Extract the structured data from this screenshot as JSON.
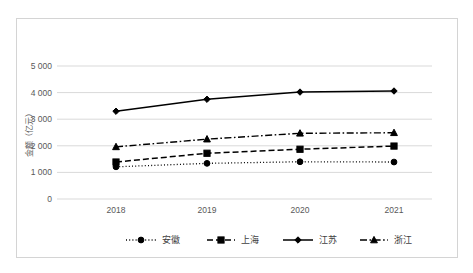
{
  "chart_data": {
    "type": "line",
    "title": "",
    "xlabel": "",
    "ylabel": "金额（亿元）",
    "categories": [
      "2018",
      "2019",
      "2020",
      "2021"
    ],
    "ylim": [
      0,
      5000
    ],
    "ytick_labels": [
      "0",
      "1 000",
      "2 000",
      "3 000",
      "4 000",
      "5 000"
    ],
    "ytick_values": [
      0,
      1000,
      2000,
      3000,
      4000,
      5000
    ],
    "grid": true,
    "legend_position": "bottom",
    "series": [
      {
        "name": "安徽",
        "values": [
          1210,
          1340,
          1400,
          1390
        ],
        "line_style": "dotted",
        "marker": "circle",
        "color": "#000000"
      },
      {
        "name": "上海",
        "values": [
          1390,
          1720,
          1870,
          1990
        ],
        "line_style": "dashed",
        "marker": "square",
        "color": "#000000"
      },
      {
        "name": "江苏",
        "values": [
          3300,
          3750,
          4020,
          4060
        ],
        "line_style": "solid",
        "marker": "diamond",
        "color": "#000000"
      },
      {
        "name": "浙江",
        "values": [
          1960,
          2250,
          2470,
          2490
        ],
        "line_style": "dashdot",
        "marker": "triangle",
        "color": "#000000"
      }
    ]
  },
  "axes": {
    "y_title": "金额（亿元）",
    "y_labels": {
      "t0": "0",
      "t1": "1 000",
      "t2": "2 000",
      "t3": "3 000",
      "t4": "4 000",
      "t5": "5 000"
    },
    "x_labels": {
      "c0": "2018",
      "c1": "2019",
      "c2": "2020",
      "c3": "2021"
    }
  },
  "legend": {
    "items": [
      {
        "label": "安徽"
      },
      {
        "label": "上海"
      },
      {
        "label": "江苏"
      },
      {
        "label": "浙江"
      }
    ]
  },
  "colors": {
    "ink": "#000000",
    "gridline": "#d9d9d9",
    "frame": "#d4d4d4",
    "tick_text": "#595959",
    "legend_text": "#3f3f3f"
  }
}
